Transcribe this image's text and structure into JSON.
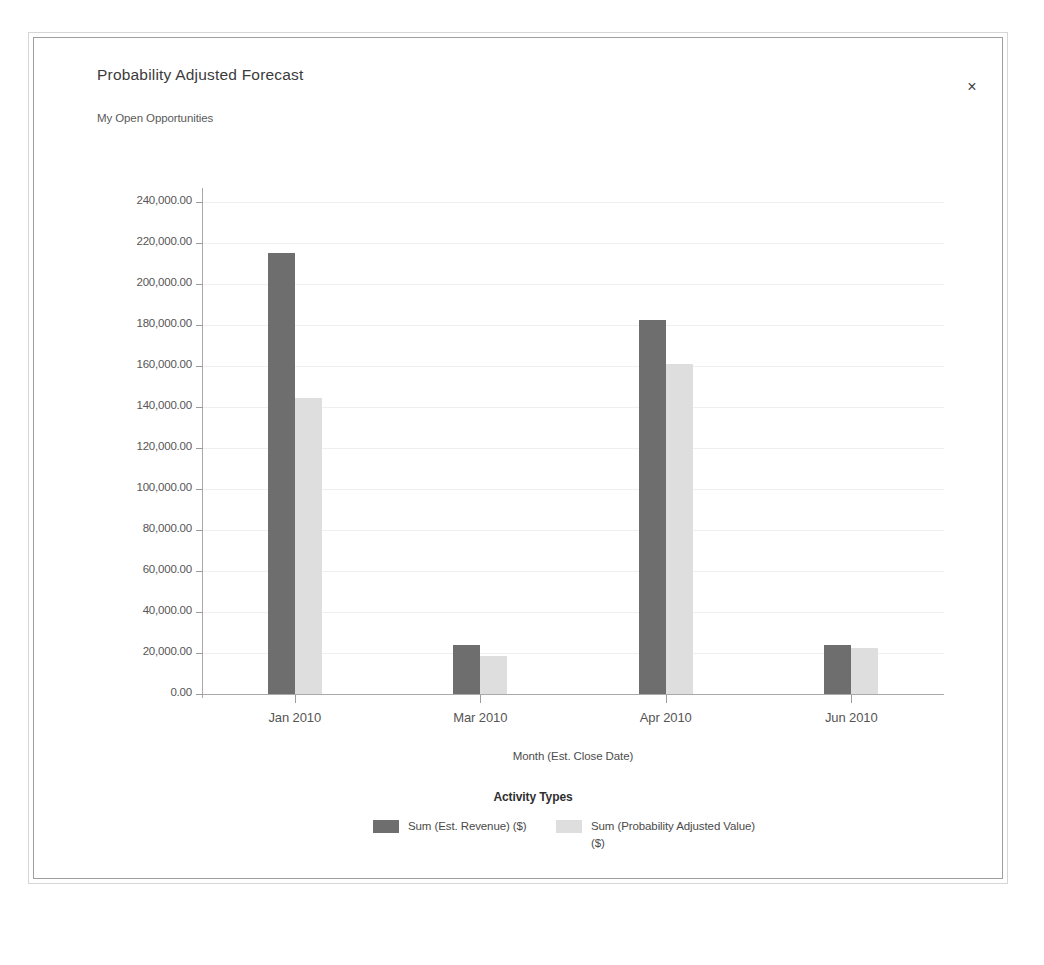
{
  "window": {
    "title": "Probability Adjusted Forecast",
    "subtitle": "My Open Opportunities",
    "close_label": "×",
    "close_icon": "close-icon"
  },
  "chart_data": {
    "type": "bar",
    "title": "Probability Adjusted Forecast",
    "subtitle": "My Open Opportunities",
    "xlabel": "Month (Est. Close Date)",
    "ylabel": "",
    "legend_title": "Activity Types",
    "legend_position": "bottom",
    "grid": true,
    "ylim": [
      0,
      245000
    ],
    "categories": [
      "Jan 2010",
      "Mar 2010",
      "Apr 2010",
      "Jun 2010"
    ],
    "ytick_labels": [
      "0.00",
      "20,000.00",
      "40,000.00",
      "60,000.00",
      "80,000.00",
      "100,000.00",
      "120,000.00",
      "140,000.00",
      "160,000.00",
      "180,000.00",
      "200,000.00",
      "220,000.00",
      "240,000.00"
    ],
    "ytick_values": [
      0,
      20000,
      40000,
      60000,
      80000,
      100000,
      120000,
      140000,
      160000,
      180000,
      200000,
      220000,
      240000
    ],
    "series": [
      {
        "name": "Sum (Est. Revenue) ($)",
        "color": "#6f6e6e",
        "values": [
          215000,
          24000,
          182500,
          24000
        ]
      },
      {
        "name": "Sum (Probability Adjusted Value) ($)",
        "color": "#dedede",
        "values": [
          144500,
          18500,
          161000,
          22500
        ]
      }
    ]
  }
}
